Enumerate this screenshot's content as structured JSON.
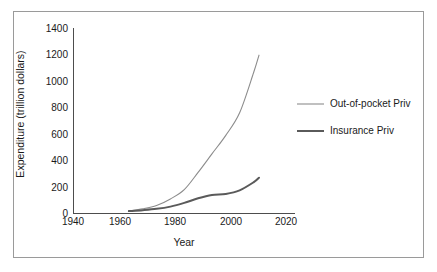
{
  "chart_data": {
    "type": "line",
    "title": "",
    "xlabel": "Year",
    "ylabel": "Expenditure (trillion dollars)",
    "xlim": [
      1940,
      2020
    ],
    "ylim": [
      0,
      1400
    ],
    "xticks": [
      "1940",
      "1960",
      "1980",
      "2000",
      "2020"
    ],
    "yticks": [
      "0",
      "200",
      "400",
      "600",
      "800",
      "1000",
      "1200",
      "1400"
    ],
    "grid": false,
    "legend_position": "right",
    "x": [
      1960,
      1965,
      1970,
      1975,
      1980,
      1985,
      1990,
      1995,
      2000,
      2005,
      2007
    ],
    "series": [
      {
        "name": "Out-of-pocket Priv",
        "color": "#8c8c8c",
        "width": 1.1,
        "values": [
          20,
          35,
          60,
          110,
          180,
          310,
          450,
          590,
          760,
          1060,
          1195
        ]
      },
      {
        "name": "Insurance Priv",
        "color": "#5a5a5a",
        "width": 2.0,
        "values": [
          18,
          25,
          35,
          52,
          80,
          115,
          140,
          148,
          175,
          235,
          270
        ]
      }
    ]
  },
  "axes": {
    "y_title": "Expenditure (trillion dollars)",
    "x_title": "Year",
    "y_tick_labels": [
      "1400",
      "1200",
      "1000",
      "800",
      "600",
      "400",
      "200",
      "0"
    ],
    "x_tick_labels": [
      "1940",
      "1960",
      "1980",
      "2000",
      "2020"
    ]
  },
  "legend": {
    "items": [
      {
        "label": "Out-of-pocket Priv",
        "color": "#8c8c8c"
      },
      {
        "label": "Insurance Priv",
        "color": "#5a5a5a"
      }
    ]
  },
  "colors": {
    "frame": "#9a9a9a",
    "axis": "#4d4d4d",
    "background": "#ffffff",
    "text": "#1a1a1a"
  }
}
